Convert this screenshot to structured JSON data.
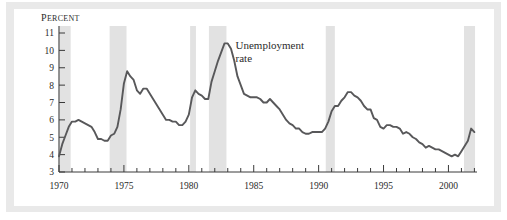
{
  "figure": {
    "frame_color": "#e9e9e9",
    "panel_color": "#ffffff"
  },
  "chart_data": {
    "type": "line",
    "title": "",
    "subtitle": "",
    "xlabel": "",
    "ylabel": "Percent",
    "ylabel_display": "PERCENT",
    "xlim": [
      1970,
      2002.2
    ],
    "ylim": [
      3,
      11
    ],
    "grid": false,
    "legend": "none",
    "line_color": "#58585a",
    "recession_band_color": "#e2e2e2",
    "axis_color": "#3a3a3a",
    "y_ticks": [
      3,
      4,
      5,
      6,
      7,
      8,
      9,
      10,
      11
    ],
    "y_tick_labels": [
      "3",
      "4",
      "5",
      "6",
      "7",
      "8",
      "9",
      "10",
      "11"
    ],
    "x_ticks_major": [
      1970,
      1975,
      1980,
      1985,
      1990,
      1995,
      2000
    ],
    "x_tick_labels": [
      "1970",
      "1975",
      "1980",
      "1985",
      "1990",
      "1995",
      "2000"
    ],
    "x_ticks_minor_step": 1,
    "annotations": [
      {
        "name": "series-label",
        "text_line1": "Unemployment",
        "text_line2": "rate",
        "x": 1983.6,
        "y": 10.1
      }
    ],
    "shaded_regions": [
      {
        "label": "recession-1970",
        "start": 1969.95,
        "end": 1970.9
      },
      {
        "label": "recession-1973-75",
        "start": 1973.9,
        "end": 1975.2
      },
      {
        "label": "recession-1980",
        "start": 1980.1,
        "end": 1980.55
      },
      {
        "label": "recession-1981-82",
        "start": 1981.55,
        "end": 1982.9
      },
      {
        "label": "recession-1990-91",
        "start": 1990.55,
        "end": 1991.25
      },
      {
        "label": "recession-2001",
        "start": 2001.2,
        "end": 2002.05
      }
    ],
    "series": [
      {
        "name": "Unemployment rate",
        "color": "#58585a",
        "x": [
          1970.0,
          1970.25,
          1970.5,
          1970.75,
          1971.0,
          1971.25,
          1971.5,
          1971.75,
          1972.0,
          1972.25,
          1972.5,
          1972.75,
          1973.0,
          1973.25,
          1973.5,
          1973.75,
          1974.0,
          1974.25,
          1974.5,
          1974.75,
          1975.0,
          1975.25,
          1975.5,
          1975.75,
          1976.0,
          1976.25,
          1976.5,
          1976.75,
          1977.0,
          1977.25,
          1977.5,
          1977.75,
          1978.0,
          1978.25,
          1978.5,
          1978.75,
          1979.0,
          1979.25,
          1979.5,
          1979.75,
          1980.0,
          1980.25,
          1980.5,
          1980.75,
          1981.0,
          1981.25,
          1981.5,
          1981.75,
          1982.0,
          1982.25,
          1982.5,
          1982.75,
          1983.0,
          1983.25,
          1983.5,
          1983.75,
          1984.0,
          1984.25,
          1984.5,
          1984.75,
          1985.0,
          1985.25,
          1985.5,
          1985.75,
          1986.0,
          1986.25,
          1986.5,
          1986.75,
          1987.0,
          1987.25,
          1987.5,
          1987.75,
          1988.0,
          1988.25,
          1988.5,
          1988.75,
          1989.0,
          1989.25,
          1989.5,
          1989.75,
          1990.0,
          1990.25,
          1990.5,
          1990.75,
          1991.0,
          1991.25,
          1991.5,
          1991.75,
          1992.0,
          1992.25,
          1992.5,
          1992.75,
          1993.0,
          1993.25,
          1993.5,
          1993.75,
          1994.0,
          1994.25,
          1994.5,
          1994.75,
          1995.0,
          1995.25,
          1995.5,
          1995.75,
          1996.0,
          1996.25,
          1996.5,
          1996.75,
          1997.0,
          1997.25,
          1997.5,
          1997.75,
          1998.0,
          1998.25,
          1998.5,
          1998.75,
          1999.0,
          1999.25,
          1999.5,
          1999.75,
          2000.0,
          2000.25,
          2000.5,
          2000.75,
          2001.0,
          2001.25,
          2001.5,
          2001.75,
          2002.0
        ],
        "y": [
          3.9,
          4.6,
          5.1,
          5.6,
          5.9,
          5.9,
          6.0,
          5.9,
          5.8,
          5.7,
          5.6,
          5.3,
          4.9,
          4.9,
          4.8,
          4.8,
          5.1,
          5.2,
          5.6,
          6.6,
          8.1,
          8.8,
          8.5,
          8.3,
          7.7,
          7.5,
          7.8,
          7.8,
          7.5,
          7.2,
          6.9,
          6.6,
          6.3,
          6.0,
          6.0,
          5.9,
          5.9,
          5.7,
          5.7,
          5.9,
          6.3,
          7.3,
          7.7,
          7.5,
          7.4,
          7.2,
          7.2,
          8.2,
          8.8,
          9.4,
          9.9,
          10.4,
          10.4,
          10.1,
          9.4,
          8.5,
          8.0,
          7.5,
          7.4,
          7.3,
          7.3,
          7.3,
          7.2,
          7.0,
          7.0,
          7.2,
          7.0,
          6.8,
          6.6,
          6.3,
          6.0,
          5.8,
          5.7,
          5.5,
          5.5,
          5.3,
          5.2,
          5.2,
          5.3,
          5.3,
          5.3,
          5.3,
          5.5,
          5.9,
          6.5,
          6.8,
          6.8,
          7.1,
          7.3,
          7.6,
          7.6,
          7.4,
          7.3,
          7.1,
          6.8,
          6.6,
          6.6,
          6.1,
          6.0,
          5.6,
          5.5,
          5.7,
          5.7,
          5.6,
          5.6,
          5.5,
          5.2,
          5.3,
          5.2,
          5.0,
          4.9,
          4.7,
          4.6,
          4.4,
          4.5,
          4.4,
          4.3,
          4.3,
          4.2,
          4.1,
          4.0,
          3.9,
          4.0,
          3.9,
          4.2,
          4.5,
          4.8,
          5.5,
          5.3
        ],
        "key_points": [
          {
            "year": 1970.0,
            "value": 3.9,
            "label": "series start"
          },
          {
            "year": 1971.5,
            "value": 6.0,
            "label": "early-1970s peak"
          },
          {
            "year": 1973.0,
            "value": 4.9,
            "label": "1973 trough"
          },
          {
            "year": 1975.25,
            "value": 8.8,
            "label": "1975 peak"
          },
          {
            "year": 1979.25,
            "value": 5.7,
            "label": "late-1970s trough"
          },
          {
            "year": 1980.5,
            "value": 7.7,
            "label": "1980 peak"
          },
          {
            "year": 1982.75,
            "value": 10.4,
            "label": "1982 peak (series max)"
          },
          {
            "year": 1989.0,
            "value": 5.2,
            "label": "1989 trough"
          },
          {
            "year": 1992.25,
            "value": 7.6,
            "label": "1992 peak"
          },
          {
            "year": 2000.25,
            "value": 3.9,
            "label": "2000 trough (series min)"
          },
          {
            "year": 2001.75,
            "value": 5.5,
            "label": "2001 rise"
          },
          {
            "year": 2002.0,
            "value": 5.3,
            "label": "series end"
          }
        ]
      }
    ]
  }
}
